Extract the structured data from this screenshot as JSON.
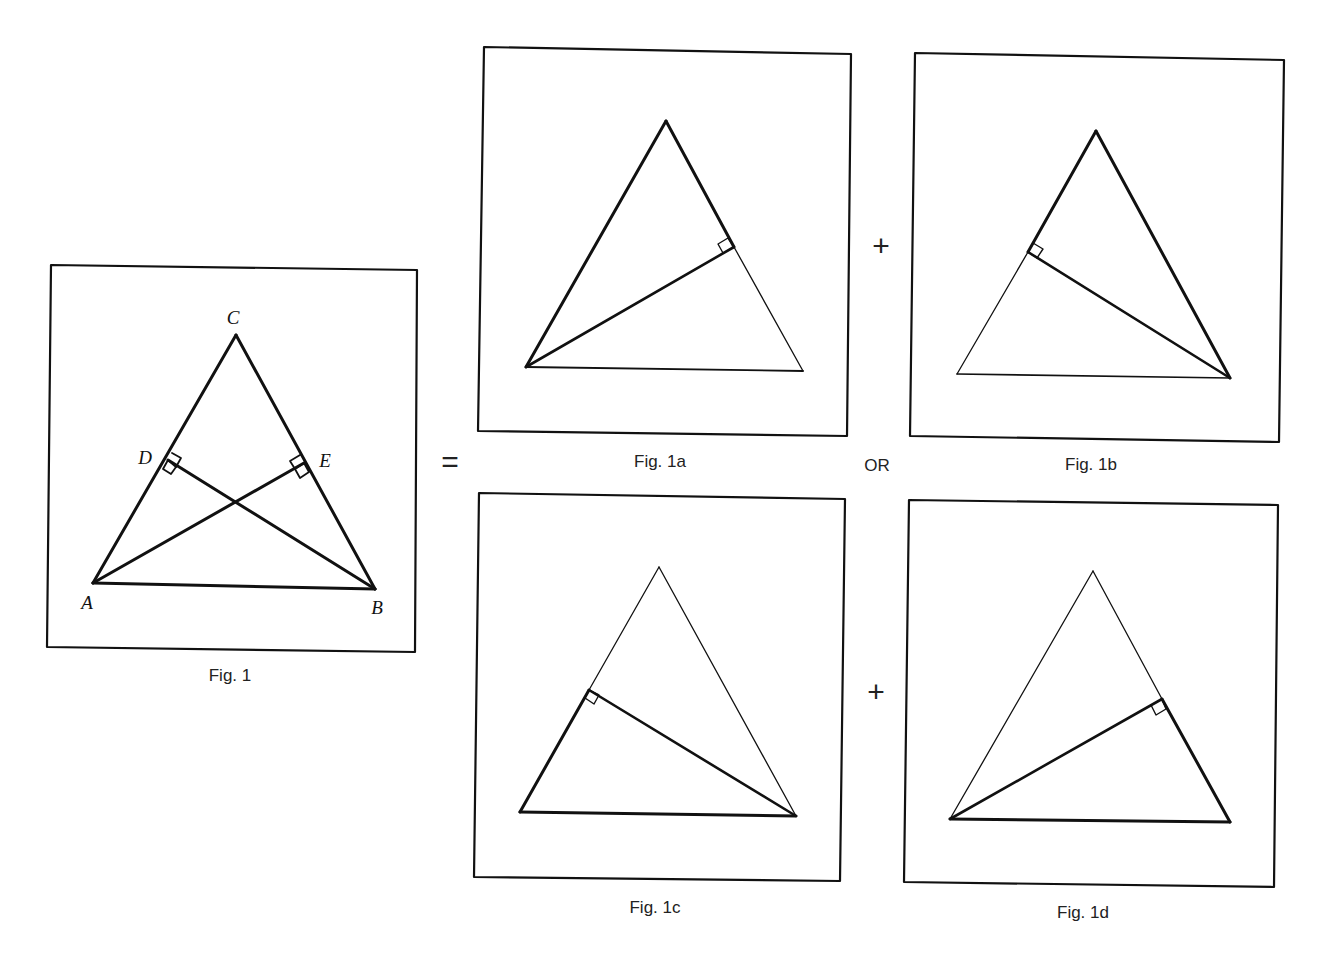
{
  "figures": [
    {
      "id": "fig1",
      "caption": "Fig. 1"
    },
    {
      "id": "fig1a",
      "caption": "Fig. 1a"
    },
    {
      "id": "fig1b",
      "caption": "Fig. 1b"
    },
    {
      "id": "fig1c",
      "caption": "Fig. 1c"
    },
    {
      "id": "fig1d",
      "caption": "Fig. 1d"
    }
  ],
  "vertex_labels": {
    "A": "A",
    "B": "B",
    "C": "C",
    "D": "D",
    "E": "E"
  },
  "operators": {
    "equals": "=",
    "plus_top": "+",
    "or": "OR",
    "plus_bottom": "+"
  },
  "colors": {
    "ink": "#111111",
    "background": "#ffffff"
  }
}
